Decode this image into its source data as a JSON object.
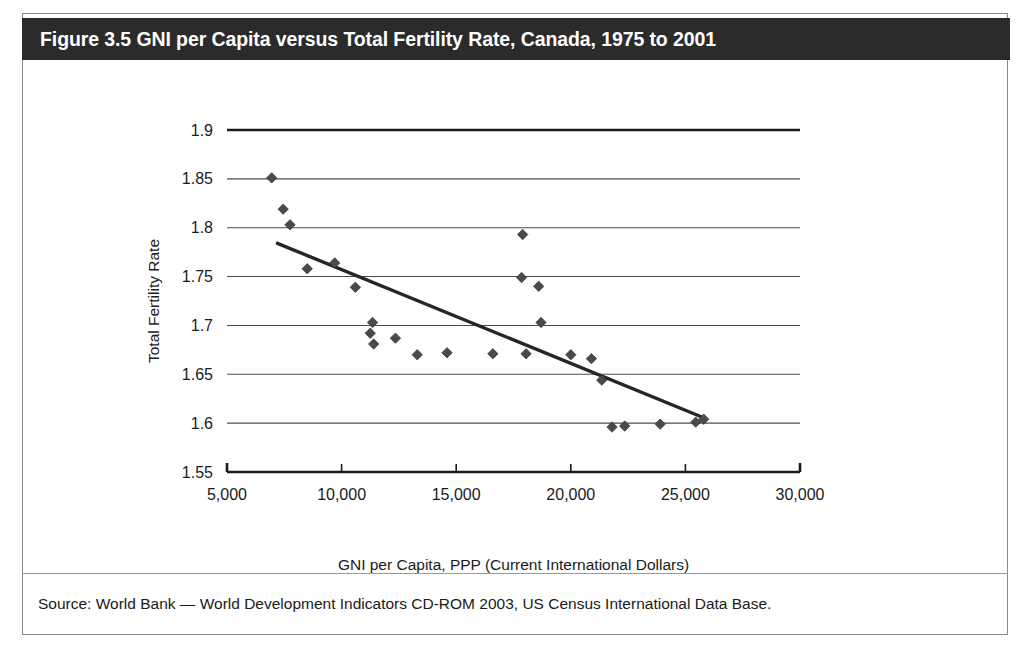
{
  "figure": {
    "title": "Figure 3.5 GNI per Capita versus Total Fertility Rate, Canada, 1975 to 2001",
    "source_note": "Source: World Bank — World Development Indicators CD-ROM 2003, US Census International Data Base.",
    "title_band_color": "#2b2b2b",
    "title_text_color": "#ffffff",
    "marker_color": "#4a4a4a",
    "trendline_color": "#262626",
    "gridline_color": "#4d4d4d"
  },
  "chart_data": {
    "type": "scatter",
    "title": "Figure 3.5 GNI per Capita versus Total Fertility Rate, Canada, 1975 to 2001",
    "xlabel": "GNI per Capita, PPP (Current International Dollars)",
    "ylabel": "Total Fertility Rate",
    "xlim": [
      5000,
      30000
    ],
    "ylim": [
      1.55,
      1.9
    ],
    "xticks": [
      5000,
      10000,
      15000,
      20000,
      25000,
      30000
    ],
    "xtick_labels": [
      "5,000",
      "10,000",
      "15,000",
      "20,000",
      "25,000",
      "30,000"
    ],
    "yticks": [
      1.55,
      1.6,
      1.65,
      1.7,
      1.75,
      1.8,
      1.85,
      1.9
    ],
    "ytick_labels": [
      "1.55",
      "1.6",
      "1.65",
      "1.7",
      "1.75",
      "1.8",
      "1.85",
      "1.9"
    ],
    "grid": "horizontal",
    "legend": "none",
    "series": [
      {
        "name": "Canada, 1975 to 2001",
        "marker": "diamond",
        "points": [
          {
            "x": 6950,
            "y": 1.851
          },
          {
            "x": 7450,
            "y": 1.819
          },
          {
            "x": 7750,
            "y": 1.803
          },
          {
            "x": 8500,
            "y": 1.758
          },
          {
            "x": 9700,
            "y": 1.764
          },
          {
            "x": 10600,
            "y": 1.739
          },
          {
            "x": 11250,
            "y": 1.692
          },
          {
            "x": 11350,
            "y": 1.703
          },
          {
            "x": 11400,
            "y": 1.681
          },
          {
            "x": 12350,
            "y": 1.687
          },
          {
            "x": 13300,
            "y": 1.67
          },
          {
            "x": 14600,
            "y": 1.672
          },
          {
            "x": 16600,
            "y": 1.671
          },
          {
            "x": 17900,
            "y": 1.793
          },
          {
            "x": 17850,
            "y": 1.749
          },
          {
            "x": 18050,
            "y": 1.671
          },
          {
            "x": 18600,
            "y": 1.74
          },
          {
            "x": 18700,
            "y": 1.703
          },
          {
            "x": 20000,
            "y": 1.67
          },
          {
            "x": 20900,
            "y": 1.666
          },
          {
            "x": 21350,
            "y": 1.644
          },
          {
            "x": 21800,
            "y": 1.596
          },
          {
            "x": 22350,
            "y": 1.597
          },
          {
            "x": 23900,
            "y": 1.599
          },
          {
            "x": 25450,
            "y": 1.601
          },
          {
            "x": 25800,
            "y": 1.604
          }
        ]
      }
    ],
    "trendline": {
      "type": "linear",
      "x_start": 7200,
      "y_start": 1.784,
      "x_end": 25850,
      "y_end": 1.605
    }
  }
}
